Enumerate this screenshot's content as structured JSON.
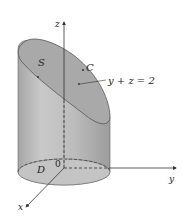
{
  "diagram": {
    "type": "3d-surface-figure",
    "labels": {
      "z_axis": "z",
      "y_axis": "y",
      "x_axis": "x",
      "origin": "0",
      "surface": "S",
      "curve": "C",
      "plane_equation": "y + z = 2",
      "region": "D"
    },
    "colors": {
      "cylinder_fill": "#b9b9b9",
      "cylinder_dark": "#9a9a9a",
      "top_surface": "#a8a8a8",
      "base_ellipse": "#c2c2c2",
      "axis": "#333333",
      "background": "#ffffff"
    }
  }
}
